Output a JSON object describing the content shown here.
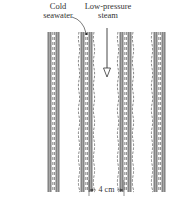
{
  "labels": {
    "cold_line1": "Cold",
    "cold_line2": "seawater",
    "steam_line1": "Low-pressure",
    "steam_line2": "steam",
    "dimension": "4 cm"
  },
  "tubes": [
    {
      "name": "tube-1",
      "x": 48
    },
    {
      "name": "tube-2",
      "x": 80
    },
    {
      "name": "tube-3",
      "x": 119
    },
    {
      "name": "tube-4",
      "x": 152
    }
  ],
  "colors": {
    "wall": "#9a9a9a",
    "line": "#444444",
    "dashed": "#555555"
  }
}
